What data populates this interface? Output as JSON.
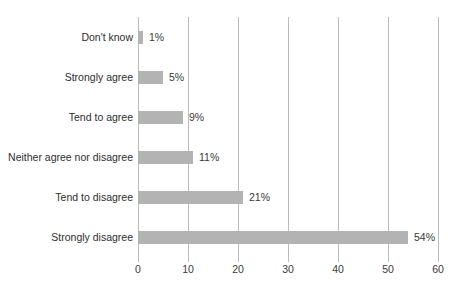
{
  "chart_data": {
    "type": "bar",
    "orientation": "horizontal",
    "title": "",
    "subtitle": "",
    "xlabel": "",
    "ylabel": "",
    "categories": [
      "Don't know",
      "Strongly agree",
      "Tend to agree",
      "Neither agree nor disagree",
      "Tend to disagree",
      "Strongly disagree"
    ],
    "values": [
      1,
      5,
      9,
      11,
      21,
      54
    ],
    "data_labels": [
      "1%",
      "5%",
      "9%",
      "11%",
      "21%",
      "54%"
    ],
    "xlim": [
      0,
      60
    ],
    "xticks": [
      0,
      10,
      20,
      30,
      40,
      50,
      60
    ],
    "xtick_labels": [
      "0",
      "10",
      "20",
      "30",
      "40",
      "50",
      "60"
    ],
    "grid": "vertical",
    "legend": "none",
    "bar_color": "#b3b3b3",
    "gridline_color": "#bcbcbc",
    "text_color": "#2e2e2e",
    "background_color": "#ffffff"
  }
}
